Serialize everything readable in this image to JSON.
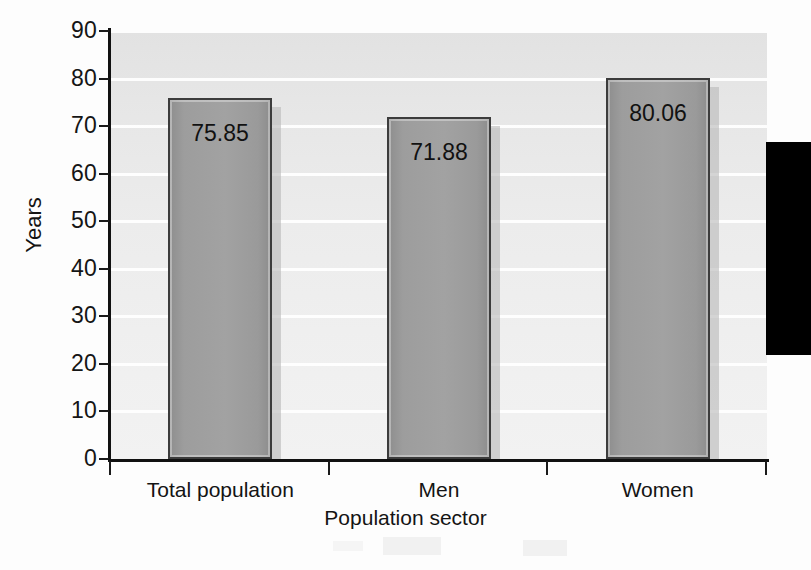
{
  "chart_data": {
    "type": "bar",
    "title": "",
    "subtitle": "",
    "xlabel": "Population sector",
    "ylabel": "Years",
    "categories": [
      "Total population",
      "Men",
      "Women"
    ],
    "values": [
      75.85,
      71.88,
      80.06
    ],
    "value_labels": [
      "75.85",
      "71.88",
      "80.06"
    ],
    "ylim": [
      0,
      90
    ],
    "ytick_labels": [
      "0",
      "10",
      "20",
      "30",
      "40",
      "50",
      "60",
      "70",
      "80",
      "90"
    ],
    "ytick_values": [
      0,
      10,
      20,
      30,
      40,
      50,
      60,
      70,
      80,
      90
    ],
    "grid": "horizontal-white-gridlines",
    "legend": "none",
    "series": [
      {
        "name": "Life expectancy",
        "values": [
          75.85,
          71.88,
          80.06
        ]
      }
    ]
  },
  "axes": {
    "y_title": "Years",
    "x_title": "Population sector"
  },
  "colors": {
    "bar_fill": "#9d9d9d",
    "bar_border": "#3c3c3c",
    "plot_background": "#ececec",
    "gridline": "#ffffff",
    "axis_line": "#111111",
    "text": "#141414",
    "scan_block": "#000000"
  },
  "artifacts": {
    "black_block_label": "scan-edge-black-block",
    "smudge_label": "scan-smudge"
  }
}
